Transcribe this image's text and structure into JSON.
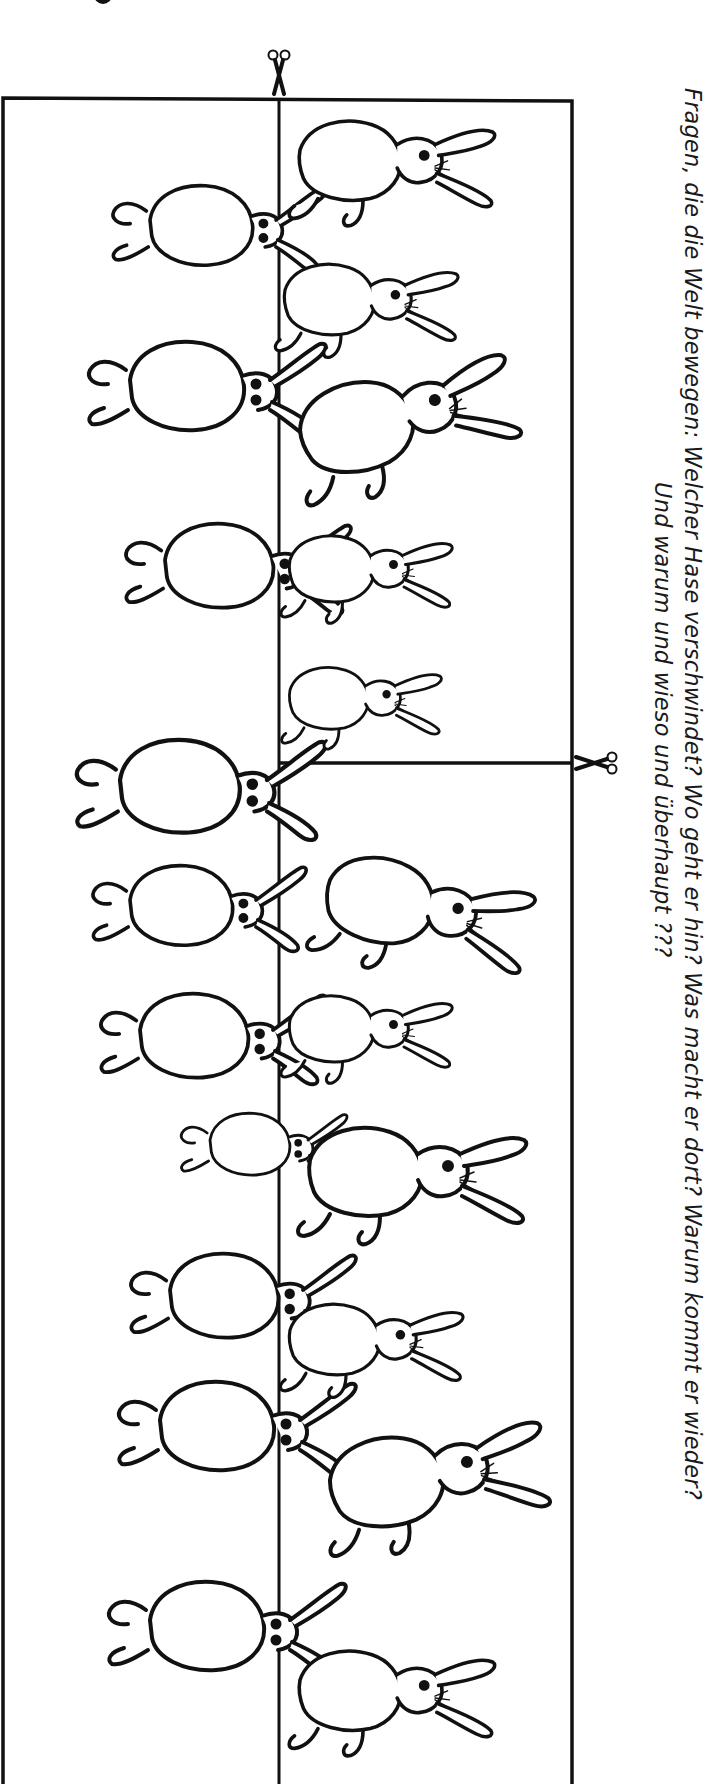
{
  "worksheet": {
    "caption": {
      "line1": "Fragen, die die Welt bewegen: Welcher Hase verschwindet? Wo geht er hin? Was macht er dort? Warum kommt er wieder?",
      "line2": "Und warum und wieso und überhaupt ???"
    },
    "puzzle": {
      "description": "Vanishing-rabbit cut-out puzzle",
      "cut_marks": [
        {
          "icon": "scissors-icon",
          "position": "top-center",
          "orientation": "handles-up"
        },
        {
          "icon": "scissors-icon",
          "position": "right-middle",
          "orientation": "handles-right"
        }
      ],
      "pieces": [
        "left-strip",
        "right-upper-panel",
        "right-lower-panel"
      ],
      "rabbit_count_left": 10,
      "rabbit_count_right": 11
    },
    "colors": {
      "ink": "#111111",
      "paper": "#ffffff"
    }
  }
}
